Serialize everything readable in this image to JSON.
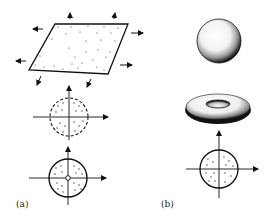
{
  "figure": {
    "panels": [
      {
        "id": "a",
        "label": "(a)",
        "elements": [
          {
            "name": "stretched-sheet",
            "shape": "parallelogram",
            "dotted": true,
            "arrows": "outward in all directions"
          },
          {
            "name": "dashed-disk",
            "shape": "circle",
            "border": "dashed",
            "dotted": true,
            "axes": true
          },
          {
            "name": "solid-disk",
            "shape": "circle",
            "border": "solid",
            "dotted": true,
            "axes": true,
            "center_marker": "hollow-circle"
          }
        ]
      },
      {
        "id": "b",
        "label": "(b)",
        "elements": [
          {
            "name": "sphere",
            "shape": "stippled-sphere"
          },
          {
            "name": "torus",
            "shape": "stippled-torus"
          },
          {
            "name": "solid-disk",
            "shape": "circle",
            "border": "solid",
            "dotted": true,
            "axes": true
          }
        ]
      }
    ],
    "colors": {
      "ink": "#111111",
      "background": "#ffffff"
    }
  }
}
